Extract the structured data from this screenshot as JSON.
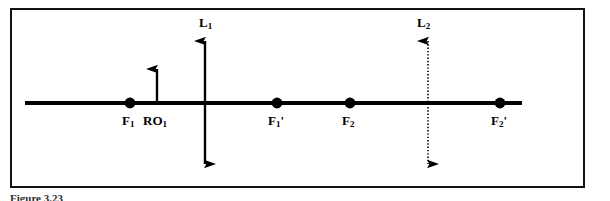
{
  "figure": {
    "frame": {
      "border_color": "#111111",
      "background": "#ffffff"
    },
    "axis": {
      "name": "optical-axis",
      "color": "#000000",
      "x_start": 25,
      "x_end": 522,
      "y": 103,
      "thickness": 4
    },
    "points": [
      {
        "id": "F1",
        "label": "F",
        "sub": "1",
        "prime": "",
        "x": 130,
        "y": 103,
        "label_x": 122,
        "label_y": 114
      },
      {
        "id": "F1p",
        "label": "F",
        "sub": "1",
        "prime": "'",
        "x": 277,
        "y": 103,
        "label_x": 268,
        "label_y": 114
      },
      {
        "id": "F2",
        "label": "F",
        "sub": "2",
        "prime": "",
        "x": 350,
        "y": 103,
        "label_x": 342,
        "label_y": 114
      },
      {
        "id": "F2p",
        "label": "F",
        "sub": "2",
        "prime": "'",
        "x": 500,
        "y": 103,
        "label_x": 491,
        "label_y": 114
      }
    ],
    "object_arrow": {
      "id": "RO1",
      "label": "RO",
      "sub": "1",
      "x": 157,
      "y_base": 103,
      "y_tip": 60,
      "label_x": 143,
      "label_y": 114,
      "style": "solid",
      "heads": "up"
    },
    "lens_lines": [
      {
        "id": "L1",
        "label": "L",
        "sub": "1",
        "x": 205,
        "y_top": 33,
        "y_bottom": 172,
        "style": "solid",
        "heads": "both",
        "label_x": 199,
        "label_y": 16
      },
      {
        "id": "L2",
        "label": "L",
        "sub": "2",
        "x": 428,
        "y_top": 33,
        "y_bottom": 172,
        "style": "dotted",
        "heads": "both",
        "label_x": 417,
        "label_y": 16
      }
    ],
    "caption": "Figure 3.23"
  }
}
